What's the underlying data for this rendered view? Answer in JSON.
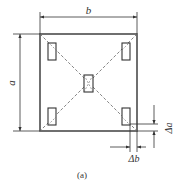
{
  "figure": {
    "caption": "(a)",
    "labels": {
      "width": "b",
      "height": "a",
      "delta_height": "Δa",
      "delta_width": "Δb"
    },
    "colors": {
      "stroke": "#333333",
      "dash": "#666666",
      "background": "#ffffff"
    }
  }
}
